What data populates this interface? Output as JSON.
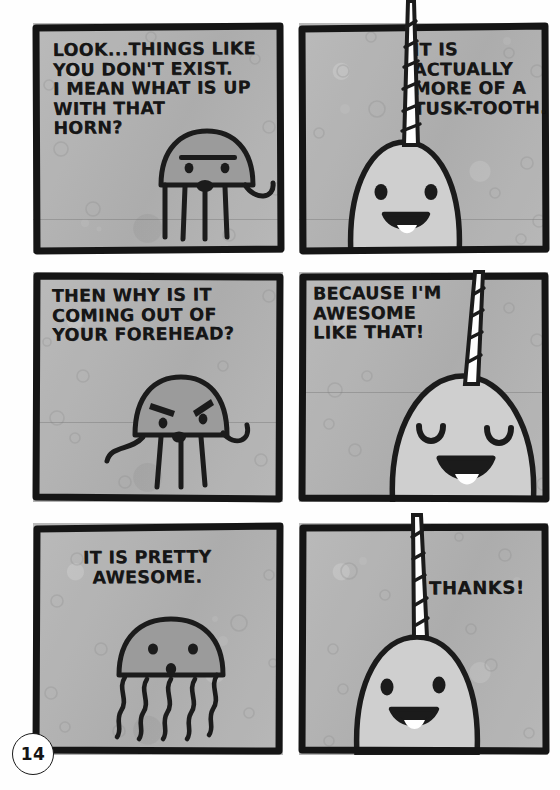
{
  "page": {
    "page_number": "14",
    "background_color": "#ffffff",
    "panel_fill_color": "#b4b4b4",
    "ink_color": "#161616",
    "layout": "2 columns x 3 rows",
    "panel_count": 6
  },
  "panels": [
    {
      "id": "panel-1",
      "position": "row 1, column 1",
      "caption": "LOOK...THINGS LIKE\nYOU DON'T EXIST.\nI MEAN WHAT IS UP\nWITH THAT\n     HORN?",
      "speaker": "jellyfish",
      "character": "jellyfish",
      "expression": "skeptical-annoyed",
      "character_details": "jellyfish with single thick eyebrow bar over two eyes, small oval mouth, five straight tentacles and one curling tentacle on right"
    },
    {
      "id": "panel-2",
      "position": "row 1, column 2",
      "caption": "IT IS\nACTUALLY\nMORE OF A\nTUSK-TOOTH.",
      "speaker": "narwhal",
      "character": "narwhal",
      "expression": "happy-open-smile",
      "character_details": "narwhal with tall striped spiral tusk extending above the panel border, two dot eyes, wide open smile with tongue"
    },
    {
      "id": "panel-3",
      "position": "row 2, column 1",
      "caption": "THEN WHY IS IT\nCOMING OUT OF\nYOUR FOREHEAD?",
      "speaker": "jellyfish",
      "character": "jellyfish",
      "expression": "angry-furrowed-brows",
      "character_details": "jellyfish with two angled angry eyebrows, two dot eyes, small oval mouth, four straight tentacles and two curling tentacles"
    },
    {
      "id": "panel-4",
      "position": "row 2, column 2",
      "caption": "BECAUSE I'M\nAWESOME\nLIKE THAT!",
      "speaker": "narwhal",
      "character": "narwhal",
      "expression": "delighted-closed-eyes",
      "character_details": "narwhal close-up with striped tusk, two U-shaped closed happy eyes, big open smile with tongue"
    },
    {
      "id": "panel-5",
      "position": "row 3, column 1",
      "caption": "IT IS PRETTY\nAWESOME.",
      "speaker": "jellyfish",
      "character": "jellyfish",
      "expression": "calm-neutral",
      "character_details": "jellyfish with two dot eyes, small oval mouth, five wavy tentacles"
    },
    {
      "id": "panel-6",
      "position": "row 3, column 2",
      "caption": "THANKS!",
      "speaker": "narwhal",
      "character": "narwhal",
      "expression": "happy-open-smile",
      "character_details": "narwhal with tall striped tusk extending above the panel border, two dot eyes, open smile with tongue"
    }
  ]
}
